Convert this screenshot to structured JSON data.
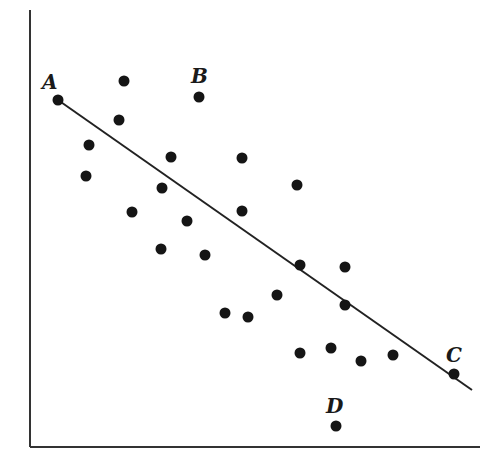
{
  "chart_data": {
    "type": "scatter",
    "title": "",
    "xlabel": "",
    "ylabel": "",
    "grid": false,
    "legend": null,
    "axes": {
      "x_axis": {
        "x1": 30,
        "y1": 447,
        "x2": 480,
        "y2": 447
      },
      "y_axis": {
        "x1": 30,
        "y1": 10,
        "x2": 30,
        "y2": 447
      }
    },
    "points": [
      {
        "x": 58,
        "y": 100,
        "label": "A"
      },
      {
        "x": 124,
        "y": 81
      },
      {
        "x": 199,
        "y": 97,
        "label": "B"
      },
      {
        "x": 119,
        "y": 120
      },
      {
        "x": 89,
        "y": 145
      },
      {
        "x": 86,
        "y": 176
      },
      {
        "x": 171,
        "y": 157
      },
      {
        "x": 242,
        "y": 158
      },
      {
        "x": 162,
        "y": 188
      },
      {
        "x": 297,
        "y": 185
      },
      {
        "x": 132,
        "y": 212
      },
      {
        "x": 187,
        "y": 221
      },
      {
        "x": 242,
        "y": 211
      },
      {
        "x": 161,
        "y": 249
      },
      {
        "x": 205,
        "y": 255
      },
      {
        "x": 300,
        "y": 265
      },
      {
        "x": 345,
        "y": 267
      },
      {
        "x": 277,
        "y": 295
      },
      {
        "x": 345,
        "y": 305
      },
      {
        "x": 225,
        "y": 313
      },
      {
        "x": 248,
        "y": 317
      },
      {
        "x": 300,
        "y": 353
      },
      {
        "x": 331,
        "y": 348
      },
      {
        "x": 361,
        "y": 361
      },
      {
        "x": 393,
        "y": 355
      },
      {
        "x": 454,
        "y": 374,
        "label": "C"
      },
      {
        "x": 336,
        "y": 426,
        "label": "D"
      }
    ],
    "regression_line": {
      "x1": 58,
      "y1": 100,
      "x2": 472,
      "y2": 390
    },
    "point_labels": [
      {
        "text": "A",
        "x": 42,
        "y": 89
      },
      {
        "text": "B",
        "x": 191,
        "y": 83
      },
      {
        "text": "C",
        "x": 446,
        "y": 362
      },
      {
        "text": "D",
        "x": 326,
        "y": 413
      }
    ]
  }
}
